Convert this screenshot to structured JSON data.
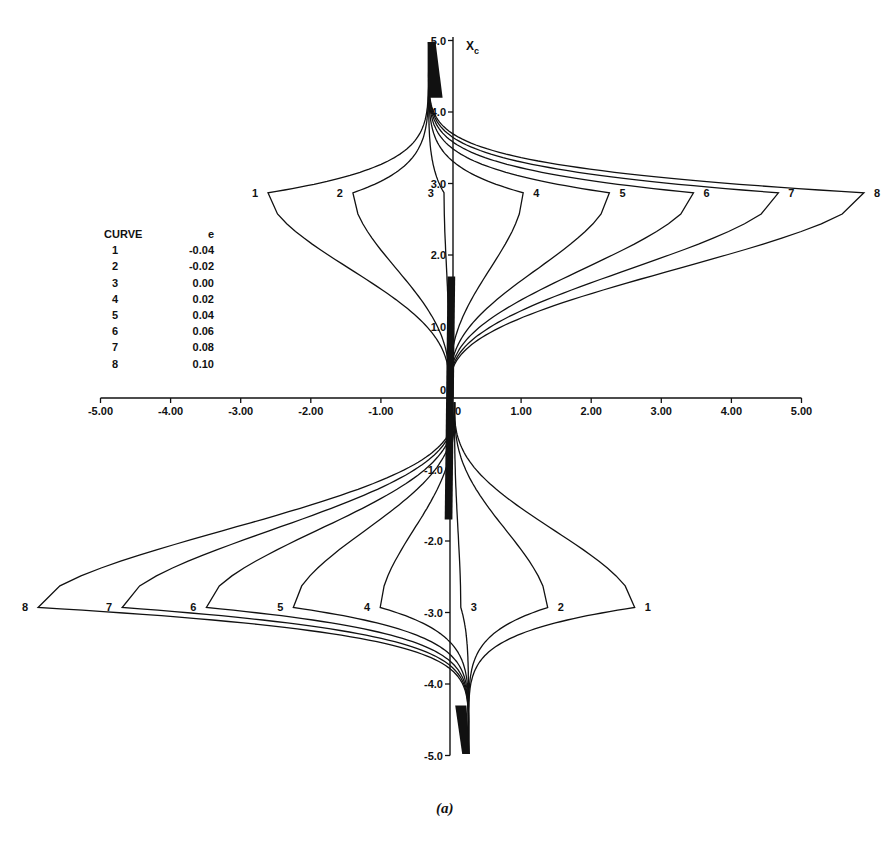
{
  "chart_data": {
    "type": "line",
    "title": "",
    "caption": "(a)",
    "xlabel": "",
    "ylabel": "X_c",
    "xlim": [
      -5.0,
      5.0
    ],
    "ylim": [
      -5.0,
      5.0
    ],
    "grid": false,
    "legend_position": "upper-left",
    "x_ticks": [
      "-5.00",
      "-4.00",
      "-3.00",
      "-2.00",
      "-1.00",
      "0",
      "1.00",
      "2.00",
      "3.00",
      "4.00",
      "5.00"
    ],
    "x_tick_values": [
      -5,
      -4,
      -3,
      -2,
      -1,
      0,
      1,
      2,
      3,
      4,
      5
    ],
    "y_ticks": [
      "5.0",
      "4.0",
      "3.0",
      "2.0",
      "1.0",
      "0",
      "-1.0",
      "-2.0",
      "-3.0",
      "-4.0",
      "-5.0"
    ],
    "y_tick_values": [
      5,
      4,
      3,
      2,
      1,
      0,
      -1,
      -2,
      -3,
      -4,
      -5
    ],
    "legend": {
      "header": [
        "CURVE",
        "e"
      ],
      "rows": [
        {
          "curve": "1",
          "e": "-0.04"
        },
        {
          "curve": "2",
          "e": "-0.02"
        },
        {
          "curve": "3",
          "e": "0.00"
        },
        {
          "curve": "4",
          "e": "0.02"
        },
        {
          "curve": "5",
          "e": "0.04"
        },
        {
          "curve": "6",
          "e": "0.06"
        },
        {
          "curve": "7",
          "e": "0.08"
        },
        {
          "curve": "8",
          "e": "0.10"
        }
      ]
    },
    "series": [
      {
        "name": "1",
        "e": -0.04,
        "upper_tip": [
          -2.61,
          2.87
        ],
        "lower_tip": [
          2.62,
          -2.93
        ]
      },
      {
        "name": "2",
        "e": -0.02,
        "upper_tip": [
          -1.4,
          2.87
        ],
        "lower_tip": [
          1.38,
          -2.93
        ]
      },
      {
        "name": "3",
        "e": 0.0,
        "upper_tip": [
          -0.1,
          2.87
        ],
        "lower_tip": [
          0.14,
          -2.93
        ]
      },
      {
        "name": "4",
        "e": 0.02,
        "upper_tip": [
          1.03,
          2.87
        ],
        "lower_tip": [
          -1.01,
          -2.93
        ]
      },
      {
        "name": "5",
        "e": 0.04,
        "upper_tip": [
          2.26,
          2.87
        ],
        "lower_tip": [
          -2.25,
          -2.93
        ]
      },
      {
        "name": "6",
        "e": 0.06,
        "upper_tip": [
          3.46,
          2.87
        ],
        "lower_tip": [
          -3.49,
          -2.93
        ]
      },
      {
        "name": "7",
        "e": 0.08,
        "upper_tip": [
          4.67,
          2.87
        ],
        "lower_tip": [
          -4.69,
          -2.93
        ]
      },
      {
        "name": "8",
        "e": 0.1,
        "upper_tip": [
          5.89,
          2.87
        ],
        "lower_tip": [
          -5.89,
          -2.93
        ]
      }
    ]
  }
}
